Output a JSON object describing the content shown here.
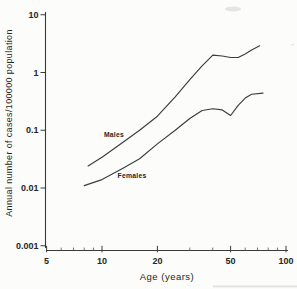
{
  "figure": {
    "background_color": "#fcfcfa",
    "line_color": "#3a3a3a",
    "text_color": "#262626"
  },
  "chart_data": {
    "type": "line",
    "title": "",
    "xlabel": "Age (years)",
    "ylabel": "Annual number of cases/100000 population",
    "x_scale": "log",
    "y_scale": "log",
    "xlim": [
      5,
      100
    ],
    "ylim": [
      0.001,
      10
    ],
    "x_tick_values": [
      5,
      10,
      20,
      50,
      100
    ],
    "x_tick_labels": [
      "5",
      "10",
      "20",
      "50",
      "100"
    ],
    "x_minor_tick_values": [
      6,
      7,
      8,
      9,
      30,
      40,
      60,
      70,
      80,
      90
    ],
    "y_tick_values": [
      10,
      1,
      0.1,
      0.01,
      0.001
    ],
    "y_tick_labels": [
      "10",
      "1",
      "0.1",
      "0.01",
      "0.001"
    ],
    "grid": false,
    "legend_position": "inline-curve-labels",
    "series": [
      {
        "name": "Males",
        "x": [
          8.4,
          10,
          13,
          16,
          20,
          25,
          30,
          35,
          40,
          45,
          50,
          55,
          60,
          65,
          72
        ],
        "y": [
          0.024,
          0.034,
          0.062,
          0.1,
          0.175,
          0.38,
          0.75,
          1.3,
          2.0,
          1.93,
          1.82,
          1.82,
          2.1,
          2.45,
          2.9
        ]
      },
      {
        "name": "Females",
        "x": [
          8,
          10,
          13,
          16,
          20,
          25,
          30,
          35,
          40,
          45,
          50,
          55,
          60,
          65,
          75
        ],
        "y": [
          0.011,
          0.014,
          0.022,
          0.032,
          0.058,
          0.1,
          0.16,
          0.22,
          0.235,
          0.225,
          0.18,
          0.27,
          0.36,
          0.42,
          0.44
        ]
      }
    ]
  }
}
